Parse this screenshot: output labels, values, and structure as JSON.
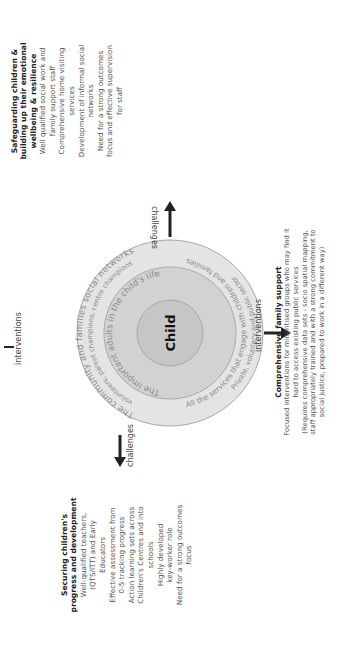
{
  "center": {
    "label": "Child"
  },
  "rings": [
    {
      "name": "inner",
      "text": "The important adults in the child's life",
      "fill": "#c9c9c9"
    },
    {
      "name": "middle-left",
      "text": "The community and families social networks",
      "subtext": "volunteers, parent champions, centre champions",
      "fill": "#e1e1e1"
    },
    {
      "name": "middle-right",
      "text": "All the services that engage with children and families",
      "subtext": "Private, voluntary and public sector",
      "fill": "#e1e1e1"
    }
  ],
  "colors": {
    "outer_ring": "#e3e3e3",
    "middle_ring": "#d0d0d0",
    "inner_circle": "#c4c4c4",
    "stroke": "#a8a8a8",
    "text_ring": "#8a8a8a"
  },
  "labels": {
    "top_interventions": "interventions",
    "right_interventions": "interventions",
    "left_challenges": "challenges",
    "right_challenges": "challenges"
  },
  "blocks": {
    "securing": {
      "title": [
        "Securing children's",
        "progress and development"
      ],
      "lines": [
        "Well-qualified teachers,",
        "(QTS/ITT) and Early",
        "Educators",
        "Effective assessment from",
        "0-5 tracking progress",
        "Action learning sets across",
        "Children's Centres and into",
        "schools",
        "Highly developed",
        "key-worker role",
        "Need for a strong outcomes",
        "focus"
      ]
    },
    "safeguarding": {
      "title": [
        "Safeguarding children &",
        "building up their emotional",
        "wellbeing & resilience"
      ],
      "lines": [
        "Well qualified social work and",
        "family support staff",
        "Comprehensive home visiting",
        "services",
        "Development of informal social",
        "networks",
        "Need for a strong outcomes",
        "focus and effective supervision",
        "for staff"
      ]
    },
    "family": {
      "title": [
        "Comprehensive family support"
      ],
      "lines": [
        "Focused interventions for minoritised  groups who may find it",
        "hard to access existing public services",
        "(Requires comprehensive data sets - socio spatial mapping,",
        "staff appropriately trained and with a strong commitment to",
        "social justice, prepared to work in a different way)"
      ]
    }
  }
}
